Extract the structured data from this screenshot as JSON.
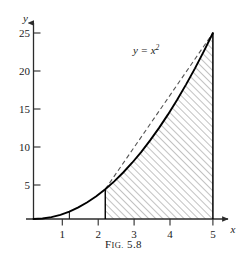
{
  "figure": {
    "caption_prefix": "F",
    "caption_small": "IG.",
    "caption_number": "5.8",
    "caption_full": "FIG. 5.8"
  },
  "chart_data": {
    "type": "line",
    "title": "",
    "xlabel": "x",
    "ylabel": "y",
    "xlim": [
      0,
      5.4
    ],
    "ylim": [
      0,
      27
    ],
    "grid": false,
    "legend": "none",
    "x_ticks": [
      1,
      2,
      3,
      4,
      5
    ],
    "x_tick_labels": [
      "1",
      "2",
      "3",
      "4",
      "5"
    ],
    "y_ticks": [
      5,
      10,
      15,
      20,
      25
    ],
    "y_tick_labels": [
      "5",
      "10",
      "15",
      "20",
      "25"
    ],
    "series": [
      {
        "name": "y = x^2",
        "style": "solid",
        "label_text": "y = x",
        "label_exponent": "2",
        "label_x": 3.05,
        "label_y": 22.2,
        "x": [
          0,
          0.25,
          0.5,
          0.75,
          1,
          1.25,
          1.5,
          1.75,
          2,
          2.25,
          2.5,
          2.75,
          3,
          3.25,
          3.5,
          3.75,
          4,
          4.25,
          4.5,
          4.75,
          5
        ],
        "y": [
          0,
          0.0625,
          0.25,
          0.5625,
          1,
          1.5625,
          2.25,
          3.0625,
          4,
          5.0625,
          6.25,
          7.5625,
          9,
          10.5625,
          12.25,
          14.0625,
          16,
          18.0625,
          20.25,
          22.5625,
          25
        ]
      },
      {
        "name": "secant chord",
        "style": "dashed",
        "x": [
          2,
          5
        ],
        "y": [
          4,
          25
        ]
      }
    ],
    "shaded_region": {
      "label": "area under y = x^2 from x = 2 to x = 5",
      "x_start": 2,
      "x_end": 5,
      "y_at_start": 4,
      "y_at_end": 25,
      "hatch": "diagonal"
    },
    "markers": [
      {
        "name": "vertical-line-at-x-1",
        "x": 1,
        "y_from": 0,
        "y_to": 1
      },
      {
        "name": "vertical-line-at-x-2",
        "x": 2,
        "y_from": 0,
        "y_to": 4
      },
      {
        "name": "vertical-line-at-x-5",
        "x": 5,
        "y_from": 0,
        "y_to": 25
      }
    ],
    "colors": {
      "curve": "#000000",
      "dashed": "#555555",
      "axis": "#2b2b2b",
      "hatch": "#6e6e6e",
      "text": "#1a1a1a"
    }
  }
}
